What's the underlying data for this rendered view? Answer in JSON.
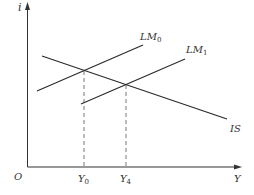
{
  "diagram": {
    "axes": {
      "y_label": "i",
      "x_label": "Y",
      "origin_label": "O"
    },
    "curves": [
      {
        "name": "LM",
        "subscript": "0"
      },
      {
        "name": "LM",
        "subscript": "1"
      },
      {
        "name": "IS",
        "subscript": ""
      }
    ],
    "x_markers": [
      {
        "name": "Y",
        "subscript": "0"
      },
      {
        "name": "Y",
        "subscript": "4"
      }
    ],
    "colors": {
      "line": "#2b2b2b",
      "dashed": "#555555",
      "background": "#ffffff"
    }
  }
}
